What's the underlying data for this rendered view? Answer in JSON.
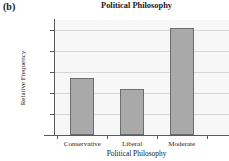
{
  "panel": {
    "label": "(b)"
  },
  "chart_data": {
    "type": "bar",
    "title": "Political Philosophy",
    "xlabel": "Political Philosophy",
    "ylabel": "Relative Frequency",
    "categories": [
      "Conservative",
      "Liberal",
      "Moderate"
    ],
    "values": [
      0.275,
      0.22,
      0.51
    ],
    "ylim": [
      0,
      0.55
    ],
    "ytick_labels": [
      "0",
      "0.1",
      "0.2",
      "0.3",
      "0.4",
      "0.5"
    ],
    "ytick_values": [
      0,
      0.1,
      0.2,
      0.3,
      0.4,
      0.5
    ],
    "grid": true,
    "legend": false,
    "bar_color": "#a9a9a9",
    "bar_edge_color": "#6e6e6e",
    "plot_background": "#f7f7f7",
    "axis_color": "#5a5a5a",
    "gridline_color": "#d6d6d6"
  }
}
